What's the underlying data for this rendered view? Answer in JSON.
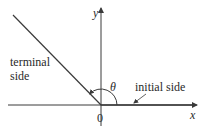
{
  "diagram": {
    "type": "angle-in-standard-position",
    "axes": {
      "x_label": "x",
      "y_label": "y",
      "origin_label": "0"
    },
    "angle": {
      "symbol": "θ",
      "terminal_side_direction_deg": 135
    },
    "labels": {
      "terminal_side_line1": "terminal",
      "terminal_side_line2": "side",
      "initial_side": "initial side"
    },
    "colors": {
      "line": "#3a3a3a",
      "text": "#2a2a2a",
      "background": "#ffffff"
    }
  }
}
